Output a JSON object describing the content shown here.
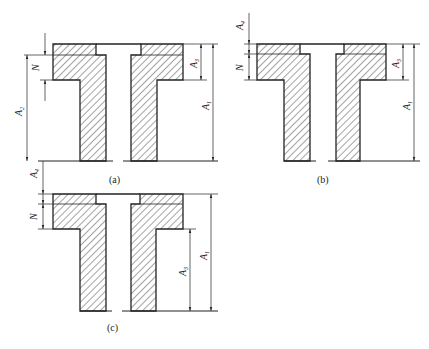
{
  "figure": {
    "caption": "",
    "panels": [
      {
        "id": "a",
        "label": "(a)",
        "dims": {
          "N": "N",
          "A2": "A",
          "A2_sub": "2",
          "A3": "A",
          "A3_sub": "3",
          "A1": "A",
          "A1_sub": "1",
          "A4": "A",
          "A4_sub": "4"
        }
      },
      {
        "id": "b",
        "label": "(b)",
        "dims": {
          "N": "N",
          "A4": "A",
          "A4_sub": "4",
          "A3": "A",
          "A3_sub": "3",
          "A1": "A",
          "A1_sub": "1"
        }
      },
      {
        "id": "c",
        "label": "(c)",
        "dims": {
          "N": "N",
          "A3": "A",
          "A3_sub": "3",
          "A1": "A",
          "A1_sub": "1"
        }
      }
    ]
  },
  "colors": {
    "stroke": "#222222",
    "hatch": "#333333",
    "background": "#ffffff"
  }
}
